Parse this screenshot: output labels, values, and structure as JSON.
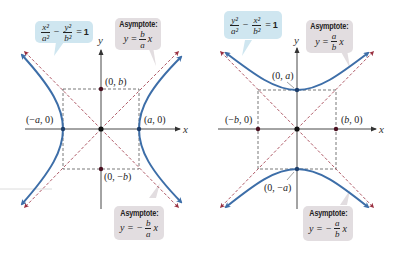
{
  "colors": {
    "curve": "#3d6ea8",
    "asymptote": "#b04a55",
    "guide": "#555555",
    "axis": "#333333",
    "eq_callout_bg": "#cfe6f0",
    "asym_callout_bg": "#e2dde0"
  },
  "left": {
    "equation": {
      "t1_num": "x²",
      "t1_den": "a²",
      "minus": "−",
      "t2_num": "y²",
      "t2_den": "b²",
      "equals": "=",
      "rhs": "1"
    },
    "asymptote_pos": {
      "title": "Asymptote:",
      "lhs": "y =",
      "num": "b",
      "den": "a",
      "var": "x"
    },
    "asymptote_neg": {
      "title": "Asymptote:",
      "lhs": "y = −",
      "num": "b",
      "den": "a",
      "var": "x"
    },
    "axis_x": "x",
    "axis_y": "y",
    "points": {
      "top": {
        "open": "(0, ",
        "var": "b",
        "close": ")"
      },
      "bottom": {
        "open": "(0, −",
        "var": "b",
        "close": ")"
      },
      "left": {
        "open": "(−",
        "var": "a",
        "close": ", 0)"
      },
      "right": {
        "open": "(",
        "var": "a",
        "close": ", 0)"
      }
    }
  },
  "right": {
    "equation": {
      "t1_num": "y²",
      "t1_den": "a²",
      "minus": "−",
      "t2_num": "x²",
      "t2_den": "b²",
      "equals": "=",
      "rhs": "1"
    },
    "asymptote_pos": {
      "title": "Asymptote:",
      "lhs": "y =",
      "num": "a",
      "den": "b",
      "var": "x"
    },
    "asymptote_neg": {
      "title": "Asymptote:",
      "lhs": "y = −",
      "num": "a",
      "den": "b",
      "var": "x"
    },
    "axis_x": "x",
    "axis_y": "y",
    "points": {
      "top": {
        "open": "(0, ",
        "var": "a",
        "close": ")"
      },
      "bottom": {
        "open": "(0, −",
        "var": "a",
        "close": ")"
      },
      "left": {
        "open": "(−",
        "var": "b",
        "close": ", 0)"
      },
      "right": {
        "open": "(",
        "var": "b",
        "close": ", 0)"
      }
    }
  }
}
